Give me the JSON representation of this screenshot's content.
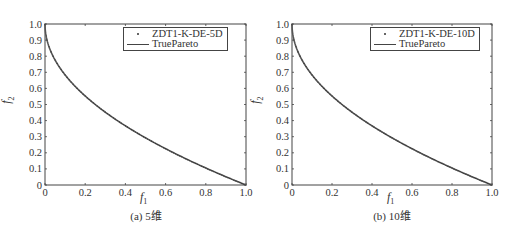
{
  "colors": {
    "axis": "#444444",
    "curve": "#555555",
    "text": "#333333",
    "background": "#ffffff"
  },
  "panels": [
    {
      "caption": "(a) 5维",
      "xlabel_main": "f",
      "xlabel_sub": "1",
      "ylabel_main": "f",
      "ylabel_sub": "2",
      "legend": {
        "series_label": "ZDT1-K-DE-5D",
        "true_label": "TruePareto"
      },
      "yticks": [
        "1.0",
        "0.9",
        "0.8",
        "0.7",
        "0.6",
        "0.5",
        "0.4",
        "0.3",
        "0.2",
        "0.1",
        "0"
      ],
      "xticks": [
        "0",
        "0.2",
        "0.4",
        "0.6",
        "0.8",
        "1.0"
      ]
    },
    {
      "caption": "(b) 10维",
      "xlabel_main": "f",
      "xlabel_sub": "1",
      "ylabel_main": "f",
      "ylabel_sub": "2",
      "legend": {
        "series_label": "ZDT1-K-DE-10D",
        "true_label": "TruePareto"
      },
      "yticks": [
        "1.0",
        "0.9",
        "0.8",
        "0.7",
        "0.6",
        "0.5",
        "0.4",
        "0.3",
        "0.2",
        "0.1",
        "0"
      ],
      "xticks": [
        "0",
        "0.2",
        "0.4",
        "0.6",
        "0.8",
        "1.0"
      ]
    }
  ],
  "chart_data": [
    {
      "type": "line",
      "title": "(a) 5维",
      "xlabel": "f1",
      "ylabel": "f2",
      "xlim": [
        0,
        1.0
      ],
      "ylim": [
        0,
        1.0
      ],
      "xticks": [
        0,
        0.2,
        0.4,
        0.6,
        0.8,
        1.0
      ],
      "yticks": [
        0,
        0.1,
        0.2,
        0.3,
        0.4,
        0.5,
        0.6,
        0.7,
        0.8,
        0.9,
        1.0
      ],
      "grid": false,
      "legend_position": "upper right",
      "series": [
        {
          "name": "ZDT1-K-DE-5D",
          "style": "dots",
          "x": [
            0,
            0.01,
            0.05,
            0.1,
            0.2,
            0.3,
            0.4,
            0.5,
            0.6,
            0.7,
            0.8,
            0.9,
            1.0
          ],
          "y": [
            1.0,
            0.9,
            0.776,
            0.684,
            0.553,
            0.452,
            0.368,
            0.293,
            0.225,
            0.163,
            0.106,
            0.051,
            0
          ]
        },
        {
          "name": "TruePareto",
          "style": "line",
          "formula": "f2 = 1 - sqrt(f1)",
          "x": [
            0,
            0.01,
            0.05,
            0.1,
            0.2,
            0.3,
            0.4,
            0.5,
            0.6,
            0.7,
            0.8,
            0.9,
            1.0
          ],
          "y": [
            1.0,
            0.9,
            0.776,
            0.684,
            0.553,
            0.452,
            0.368,
            0.293,
            0.225,
            0.163,
            0.106,
            0.051,
            0
          ]
        }
      ]
    },
    {
      "type": "line",
      "title": "(b) 10维",
      "xlabel": "f1",
      "ylabel": "f2",
      "xlim": [
        0,
        1.0
      ],
      "ylim": [
        0,
        1.0
      ],
      "xticks": [
        0,
        0.2,
        0.4,
        0.6,
        0.8,
        1.0
      ],
      "yticks": [
        0,
        0.1,
        0.2,
        0.3,
        0.4,
        0.5,
        0.6,
        0.7,
        0.8,
        0.9,
        1.0
      ],
      "grid": false,
      "legend_position": "upper right",
      "series": [
        {
          "name": "ZDT1-K-DE-10D",
          "style": "dots",
          "x": [
            0,
            0.01,
            0.05,
            0.1,
            0.2,
            0.3,
            0.4,
            0.5,
            0.6,
            0.7,
            0.8,
            0.9,
            1.0
          ],
          "y": [
            1.0,
            0.9,
            0.776,
            0.684,
            0.553,
            0.452,
            0.368,
            0.293,
            0.225,
            0.163,
            0.106,
            0.051,
            0
          ]
        },
        {
          "name": "TruePareto",
          "style": "line",
          "formula": "f2 = 1 - sqrt(f1)",
          "x": [
            0,
            0.01,
            0.05,
            0.1,
            0.2,
            0.3,
            0.4,
            0.5,
            0.6,
            0.7,
            0.8,
            0.9,
            1.0
          ],
          "y": [
            1.0,
            0.9,
            0.776,
            0.684,
            0.553,
            0.452,
            0.368,
            0.293,
            0.225,
            0.163,
            0.106,
            0.051,
            0
          ]
        }
      ]
    }
  ]
}
